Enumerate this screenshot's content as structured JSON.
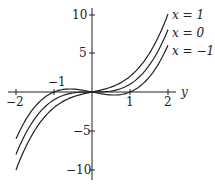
{
  "chart_data": {
    "type": "line",
    "title": "",
    "xlabel": "y",
    "ylabel": "",
    "xlim": [
      -2,
      2
    ],
    "ylim": [
      -10,
      10
    ],
    "grid": false,
    "legend_position": "right, inline labels at curve ends",
    "x_ticks": [
      -2,
      -1,
      1,
      2
    ],
    "x_tick_labels": [
      "−2",
      "−1",
      "1",
      "2"
    ],
    "y_ticks": [
      10,
      5,
      -5,
      -10
    ],
    "y_tick_labels": [
      "10",
      "5",
      "−5",
      "−10"
    ],
    "x": [
      -2,
      -1.5,
      -1,
      -0.5,
      0,
      0.5,
      1,
      1.5,
      2
    ],
    "series": [
      {
        "name": "x = 1",
        "values": [
          -10,
          -4.875,
          -2,
          -0.625,
          0,
          0.625,
          2,
          4.875,
          10
        ]
      },
      {
        "name": "x = 0",
        "values": [
          -8,
          -3.375,
          -1,
          -0.125,
          0,
          0.125,
          1,
          3.375,
          8
        ]
      },
      {
        "name": "x = −1",
        "values": [
          -6,
          -1.875,
          0,
          0.375,
          0,
          -0.375,
          0,
          1.875,
          6
        ]
      }
    ]
  },
  "labels": {
    "axis_var": "y",
    "legend": [
      "x = 1",
      "x = 0",
      "x = −1"
    ],
    "xt": [
      "−2",
      "−1",
      "1",
      "2"
    ],
    "yt": [
      "10",
      "5",
      "−5",
      "−10"
    ]
  }
}
